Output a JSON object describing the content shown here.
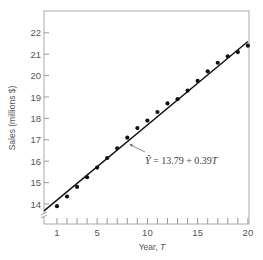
{
  "chart_data": {
    "type": "scatter",
    "title": "",
    "xlabel": "Year, T",
    "ylabel": "Sales (millions $)",
    "xlim": [
      0,
      20
    ],
    "ylim": [
      13.5,
      23
    ],
    "x_ticks_major": [
      1,
      5,
      10,
      15,
      20
    ],
    "x_ticks_minor": [
      1,
      2,
      3,
      4,
      5,
      6,
      7,
      8,
      9,
      10,
      11,
      12,
      13,
      14,
      15,
      16,
      17,
      18,
      19,
      20
    ],
    "y_ticks": [
      14,
      15,
      16,
      17,
      18,
      19,
      20,
      21,
      22
    ],
    "grid": false,
    "axis_break": "y",
    "series": [
      {
        "name": "Observed sales",
        "x": [
          1,
          2,
          3,
          4,
          5,
          6,
          7,
          8,
          9,
          10,
          11,
          12,
          13,
          14,
          15,
          16,
          17,
          18,
          19,
          20
        ],
        "y": [
          13.9,
          14.35,
          14.8,
          15.25,
          15.7,
          16.15,
          16.6,
          17.1,
          17.55,
          17.9,
          18.3,
          18.7,
          18.9,
          19.3,
          19.75,
          20.2,
          20.6,
          20.9,
          21.1,
          21.4
        ]
      }
    ],
    "trend_line": {
      "intercept": 13.79,
      "slope": 0.39,
      "x_range": [
        0,
        20
      ]
    },
    "annotations": [
      {
        "text_hat": "Ŷ",
        "text": " = 13.79 + 0.39T",
        "points_to_x": 8
      }
    ]
  }
}
